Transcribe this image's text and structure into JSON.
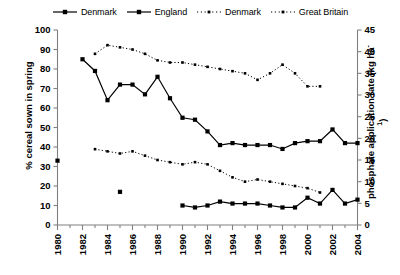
{
  "chart_data": {
    "type": "line",
    "title": "",
    "xlabel": "",
    "ylabel": "% cereal sown in spring",
    "ylabel_right": "phosphate application rate (kg ha-1)",
    "ylabel_right_base": "phosphate application rate (kg ha",
    "ylabel_right_sup": "-1",
    "ylabel_right_close": ")",
    "xlim": [
      1980,
      2004
    ],
    "ylim": [
      0,
      100
    ],
    "ylim_right": [
      0,
      45
    ],
    "xticks": [
      1980,
      1982,
      1984,
      1986,
      1988,
      1990,
      1992,
      1994,
      1996,
      1998,
      2000,
      2002,
      2004
    ],
    "xticks_minor": [
      1981,
      1983,
      1985,
      1987,
      1989,
      1991,
      1993,
      1995,
      1997,
      1999,
      2001,
      2003
    ],
    "yticks": [
      0,
      10,
      20,
      30,
      40,
      50,
      60,
      70,
      80,
      90,
      100
    ],
    "yticks_right": [
      0,
      5,
      10,
      15,
      20,
      25,
      30,
      35,
      40,
      45
    ],
    "grid": false,
    "legend_position": "top-center",
    "series": [
      {
        "name": "Denmark",
        "axis": "left",
        "style": "solid",
        "marker": "square",
        "color": "#000000",
        "points": [
          {
            "x": 1980,
            "y": 33,
            "isolated": true
          },
          {
            "x": 1982,
            "y": 85
          },
          {
            "x": 1983,
            "y": 79
          },
          {
            "x": 1984,
            "y": 64
          },
          {
            "x": 1985,
            "y": 72
          },
          {
            "x": 1986,
            "y": 72
          },
          {
            "x": 1987,
            "y": 67
          },
          {
            "x": 1988,
            "y": 76
          },
          {
            "x": 1989,
            "y": 65
          },
          {
            "x": 1990,
            "y": 55
          },
          {
            "x": 1991,
            "y": 54
          },
          {
            "x": 1992,
            "y": 48
          },
          {
            "x": 1993,
            "y": 41
          },
          {
            "x": 1994,
            "y": 42
          },
          {
            "x": 1995,
            "y": 41
          },
          {
            "x": 1996,
            "y": 41
          },
          {
            "x": 1997,
            "y": 41
          },
          {
            "x": 1998,
            "y": 39
          },
          {
            "x": 1999,
            "y": 42
          },
          {
            "x": 2000,
            "y": 43
          },
          {
            "x": 2001,
            "y": 43
          },
          {
            "x": 2002,
            "y": 49
          },
          {
            "x": 2003,
            "y": 42
          },
          {
            "x": 2004,
            "y": 42
          }
        ]
      },
      {
        "name": "England",
        "axis": "left",
        "style": "solid",
        "marker": "square",
        "color": "#000000",
        "points": [
          {
            "x": 1985,
            "y": 17,
            "isolated": true
          },
          {
            "x": 1990,
            "y": 10
          },
          {
            "x": 1991,
            "y": 9
          },
          {
            "x": 1992,
            "y": 10
          },
          {
            "x": 1993,
            "y": 12
          },
          {
            "x": 1994,
            "y": 11
          },
          {
            "x": 1995,
            "y": 11
          },
          {
            "x": 1996,
            "y": 11
          },
          {
            "x": 1997,
            "y": 10
          },
          {
            "x": 1998,
            "y": 9
          },
          {
            "x": 1999,
            "y": 9
          },
          {
            "x": 2000,
            "y": 14
          },
          {
            "x": 2001,
            "y": 11
          },
          {
            "x": 2002,
            "y": 18
          },
          {
            "x": 2003,
            "y": 11
          },
          {
            "x": 2004,
            "y": 13
          }
        ]
      },
      {
        "name": "Denmark",
        "axis": "right",
        "style": "dashed",
        "marker": "small-square",
        "color": "#000000",
        "points": [
          {
            "x": 1983,
            "y": 39.5
          },
          {
            "x": 1984,
            "y": 41.5
          },
          {
            "x": 1985,
            "y": 41
          },
          {
            "x": 1986,
            "y": 40.5
          },
          {
            "x": 1987,
            "y": 39.5
          },
          {
            "x": 1988,
            "y": 38
          },
          {
            "x": 1989,
            "y": 37.5
          },
          {
            "x": 1990,
            "y": 37.5
          },
          {
            "x": 1991,
            "y": 37
          },
          {
            "x": 1992,
            "y": 36.5
          },
          {
            "x": 1993,
            "y": 36
          },
          {
            "x": 1994,
            "y": 35.5
          },
          {
            "x": 1995,
            "y": 35
          },
          {
            "x": 1996,
            "y": 33.5
          },
          {
            "x": 1997,
            "y": 35
          },
          {
            "x": 1998,
            "y": 37
          },
          {
            "x": 1999,
            "y": 35
          },
          {
            "x": 2000,
            "y": 32
          },
          {
            "x": 2001,
            "y": 32
          }
        ]
      },
      {
        "name": "Great Britain",
        "axis": "right",
        "style": "dashed",
        "marker": "small-square",
        "color": "#000000",
        "points": [
          {
            "x": 1983,
            "y": 17.5
          },
          {
            "x": 1984,
            "y": 17
          },
          {
            "x": 1985,
            "y": 16.5
          },
          {
            "x": 1986,
            "y": 17
          },
          {
            "x": 1987,
            "y": 16
          },
          {
            "x": 1988,
            "y": 15
          },
          {
            "x": 1989,
            "y": 14.5
          },
          {
            "x": 1990,
            "y": 14
          },
          {
            "x": 1991,
            "y": 14.5
          },
          {
            "x": 1992,
            "y": 14
          },
          {
            "x": 1993,
            "y": 12.5
          },
          {
            "x": 1994,
            "y": 11
          },
          {
            "x": 1995,
            "y": 10
          },
          {
            "x": 1996,
            "y": 10.5
          },
          {
            "x": 1997,
            "y": 10
          },
          {
            "x": 1998,
            "y": 9.5
          },
          {
            "x": 1999,
            "y": 9
          },
          {
            "x": 2000,
            "y": 8.5
          },
          {
            "x": 2001,
            "y": 7.5
          }
        ]
      }
    ],
    "legend": [
      {
        "label": "Denmark",
        "style": "solid",
        "marker": "square"
      },
      {
        "label": "England",
        "style": "solid",
        "marker": "square"
      },
      {
        "label": "Denmark",
        "style": "dashed",
        "marker": "small-square"
      },
      {
        "label": "Great Britain",
        "style": "dashed",
        "marker": "small-square"
      }
    ]
  }
}
